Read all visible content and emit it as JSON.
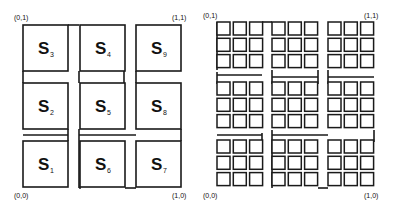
{
  "left_diagram": {
    "corners": {
      "top_left": "(0,1)",
      "top_right": "(1,1)",
      "bottom_left": "(0,0)",
      "bottom_right": "(1,0)"
    },
    "cells": [
      {
        "id": "S1",
        "main": "S",
        "sub": "1",
        "col": 0,
        "row": 2
      },
      {
        "id": "S2",
        "main": "S",
        "sub": "2",
        "col": 0,
        "row": 1
      },
      {
        "id": "S3",
        "main": "S",
        "sub": "3",
        "col": 0,
        "row": 0
      },
      {
        "id": "S4",
        "main": "S",
        "sub": "4",
        "col": 1,
        "row": 0
      },
      {
        "id": "S5",
        "main": "S",
        "sub": "5",
        "col": 1,
        "row": 1
      },
      {
        "id": "S6",
        "main": "S",
        "sub": "6",
        "col": 1,
        "row": 2
      },
      {
        "id": "S7",
        "main": "S",
        "sub": "7",
        "col": 2,
        "row": 2
      },
      {
        "id": "S8",
        "main": "S",
        "sub": "8",
        "col": 2,
        "row": 1
      },
      {
        "id": "S9",
        "main": "S",
        "sub": "9",
        "col": 2,
        "row": 0
      }
    ]
  },
  "right_diagram": {
    "corners": {
      "top_left": "(0,1)",
      "top_right": "(1,1)",
      "bottom_left": "(0,0)",
      "bottom_right": "(1,0)"
    },
    "description": "Second iteration: each S_i subdivided into 3x3 smaller squares"
  },
  "colors": {
    "stroke": "#1a1a1a",
    "background": "#ffffff"
  }
}
